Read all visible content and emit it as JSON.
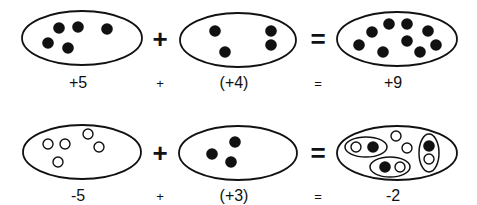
{
  "diagram": {
    "rows": [
      {
        "id": "row-1",
        "sets": [
          {
            "id": "a",
            "cx": 82,
            "cy": 38,
            "rx": 60,
            "ry": 27,
            "label": "+5",
            "counters": [
              {
                "x": 59,
                "y": 28,
                "type": "positive"
              },
              {
                "x": 78,
                "y": 27,
                "type": "positive"
              },
              {
                "x": 107,
                "y": 29,
                "type": "positive"
              },
              {
                "x": 48,
                "y": 43,
                "type": "positive"
              },
              {
                "x": 68,
                "y": 48,
                "type": "positive"
              }
            ]
          },
          {
            "id": "b",
            "cx": 238,
            "cy": 40,
            "rx": 58,
            "ry": 27,
            "label": "(+4)",
            "counters": [
              {
                "x": 215,
                "y": 31,
                "type": "positive"
              },
              {
                "x": 225,
                "y": 52,
                "type": "positive"
              },
              {
                "x": 271,
                "y": 31,
                "type": "positive"
              },
              {
                "x": 271,
                "y": 45,
                "type": "positive"
              }
            ]
          },
          {
            "id": "c",
            "cx": 397,
            "cy": 39,
            "rx": 60,
            "ry": 27,
            "label": "+9",
            "counters": [
              {
                "x": 372,
                "y": 32,
                "type": "positive"
              },
              {
                "x": 389,
                "y": 24,
                "type": "positive"
              },
              {
                "x": 407,
                "y": 24,
                "type": "positive"
              },
              {
                "x": 428,
                "y": 31,
                "type": "positive"
              },
              {
                "x": 359,
                "y": 45,
                "type": "positive"
              },
              {
                "x": 407,
                "y": 41,
                "type": "positive"
              },
              {
                "x": 383,
                "y": 52,
                "type": "positive"
              },
              {
                "x": 420,
                "y": 52,
                "type": "positive"
              },
              {
                "x": 436,
                "y": 45,
                "type": "positive"
              }
            ]
          }
        ],
        "big_operators": [
          {
            "symbol": "+",
            "x": 160,
            "y": 48
          },
          {
            "symbol": "=",
            "x": 318,
            "y": 48
          }
        ],
        "label_y": 88,
        "small_operators": [
          {
            "symbol": "+",
            "x": 160,
            "y": 88
          },
          {
            "symbol": "=",
            "x": 318,
            "y": 88
          }
        ]
      },
      {
        "id": "row-2",
        "sets": [
          {
            "id": "a",
            "cx": 82,
            "cy": 152,
            "rx": 59,
            "ry": 27,
            "label": "-5",
            "counters": [
              {
                "x": 48,
                "y": 144,
                "type": "negative"
              },
              {
                "x": 65,
                "y": 144,
                "type": "negative"
              },
              {
                "x": 88,
                "y": 134,
                "type": "negative"
              },
              {
                "x": 99,
                "y": 147,
                "type": "negative"
              },
              {
                "x": 58,
                "y": 162,
                "type": "negative"
              }
            ]
          },
          {
            "id": "b",
            "cx": 238,
            "cy": 153,
            "rx": 59,
            "ry": 27,
            "label": "(+3)",
            "counters": [
              {
                "x": 235,
                "y": 142,
                "type": "positive"
              },
              {
                "x": 212,
                "y": 154,
                "type": "positive"
              },
              {
                "x": 231,
                "y": 162,
                "type": "positive"
              }
            ]
          },
          {
            "id": "c",
            "cx": 397,
            "cy": 153,
            "rx": 60,
            "ry": 27,
            "label": "-2",
            "zero_pairs": [
              {
                "cx": 366,
                "cy": 147,
                "rx": 21,
                "ry": 10
              },
              {
                "cx": 390,
                "cy": 167,
                "rx": 20,
                "ry": 10
              },
              {
                "cx": 429,
                "cy": 153,
                "rx": 10,
                "ry": 19
              }
            ],
            "counters": [
              {
                "x": 356,
                "y": 147,
                "type": "negative"
              },
              {
                "x": 373,
                "y": 147,
                "type": "positive"
              },
              {
                "x": 385,
                "y": 167,
                "type": "positive"
              },
              {
                "x": 400,
                "y": 167,
                "type": "negative"
              },
              {
                "x": 429,
                "y": 146,
                "type": "positive"
              },
              {
                "x": 429,
                "y": 159,
                "type": "negative"
              },
              {
                "x": 396,
                "y": 136,
                "type": "negative"
              },
              {
                "x": 407,
                "y": 148,
                "type": "negative"
              }
            ]
          }
        ],
        "big_operators": [
          {
            "symbol": "+",
            "x": 160,
            "y": 162
          },
          {
            "symbol": "=",
            "x": 318,
            "y": 162
          }
        ],
        "label_y": 201,
        "small_operators": [
          {
            "symbol": "+",
            "x": 160,
            "y": 201
          },
          {
            "symbol": "=",
            "x": 318,
            "y": 201
          }
        ]
      }
    ],
    "legend": {
      "positive": "filled black counter",
      "negative": "open white counter"
    },
    "colors": {
      "ink": "#111111",
      "background": "#ffffff"
    }
  }
}
